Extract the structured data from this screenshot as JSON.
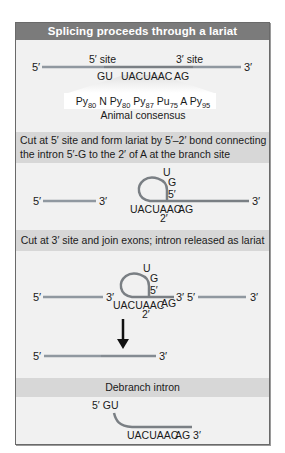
{
  "title": "Splicing proceeds through a lariat",
  "colors": {
    "title_bar": "#7b7b7b",
    "band": "#d7d7d7",
    "panel": "#f1f1f1",
    "exon_line": "#8e969e",
    "intron_line": "#7a7f84",
    "arrow": "#111111"
  },
  "section1": {
    "five_prime": "5′",
    "three_prime": "3′",
    "site5_label": "5′ site",
    "site3_label": "3′ site",
    "seq_gu": "GU",
    "seq_branch": "UACUAAC",
    "seq_ag": "AG",
    "consensus": {
      "items": [
        {
          "base": "Py",
          "sub": "80"
        },
        {
          "base": "N",
          "sub": ""
        },
        {
          "base": "Py",
          "sub": "80"
        },
        {
          "base": "Py",
          "sub": "87"
        },
        {
          "base": "Pu",
          "sub": "75"
        },
        {
          "base": "A",
          "sub": ""
        },
        {
          "base": "Py",
          "sub": "95"
        }
      ],
      "label": "Animal consensus"
    }
  },
  "section2": {
    "text_line1": "Cut at 5′ site and form lariat by 5′–2′ bond connecting",
    "text_line2": "the intron 5′-G to the 2′ of A at the branch site",
    "exon1_5": "5′",
    "exon1_3": "3′",
    "loop_u": "U",
    "loop_g": "G",
    "loop_5": "5′",
    "branch_seq": "UACUAAC",
    "branch_ag": "AG",
    "branch_2": "2′",
    "tail_3": "3′"
  },
  "section3": {
    "text": "Cut at 3′ site and  join exons; intron released as lariat",
    "exon1_5": "5′",
    "exon1_3": "3′",
    "loop_u": "U",
    "loop_g": "G",
    "loop_5": "5′",
    "branch_seq": "UACUAAC",
    "branch_ag": "AG",
    "branch_2": "2′",
    "lariat_3": "3′",
    "exon2_5": "5′",
    "exon2_3": "3′",
    "joined_5": "5′",
    "joined_3": "3′"
  },
  "section4": {
    "text": "Debranch intron",
    "gu_label": "5′ GU",
    "seq": "UACUAAC",
    "ag": "AG 3′"
  }
}
